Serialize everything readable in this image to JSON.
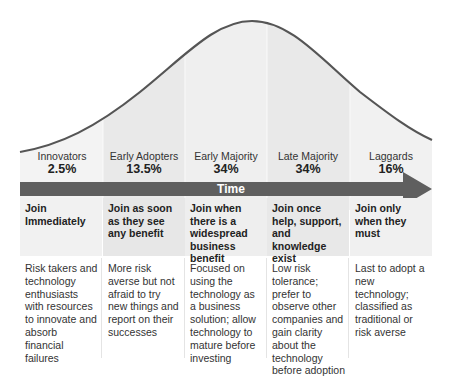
{
  "diagram": {
    "curve": {
      "type": "bell",
      "stroke": "#555555",
      "fill": "#ececec"
    },
    "timeline": {
      "label": "Time",
      "color": "#5f5f5f"
    },
    "colors": {
      "header_bg_light": "#efefef",
      "header_bg_dark": "#e6e6e6",
      "divider": "#e4e4e4"
    },
    "segments": [
      {
        "name": "Innovators",
        "percent": "2.5%",
        "when": "Join Immediately",
        "description": "Risk takers and technology enthusiasts with resources to innovate and absorb financial failures"
      },
      {
        "name": "Early Adopters",
        "percent": "13.5%",
        "when": "Join as soon as they see any benefit",
        "description": "More risk averse but not afraid to try new things and report on their successes"
      },
      {
        "name": "Early Majority",
        "percent": "34%",
        "when": "Join when there is a widespread business benefit",
        "description": "Focused on using the technology as a business solution; allow technology to mature before investing"
      },
      {
        "name": "Late Majority",
        "percent": "34%",
        "when": "Join once help, support, and knowledge exist",
        "description": "Low risk tolerance; prefer to observe other companies and gain clarity about the technology before adoption"
      },
      {
        "name": "Laggards",
        "percent": "16%",
        "when": "Join only when they must",
        "description": "Last to adopt a new technology; classified as traditional or risk averse"
      }
    ]
  }
}
